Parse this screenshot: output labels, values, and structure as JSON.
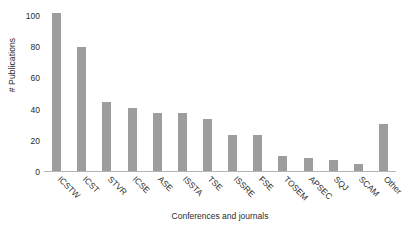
{
  "chart_data": {
    "type": "bar",
    "title": "",
    "xlabel": "Conferences and journals",
    "ylabel": "# Publications",
    "categories": [
      "ICSTW",
      "ICST",
      "STVR",
      "ICSE",
      "ASE",
      "ISSTA",
      "TSE",
      "ISSRE",
      "FSE",
      "TOSEM",
      "APSEC",
      "SQJ",
      "SCAM",
      "Other"
    ],
    "values": [
      102,
      80,
      45,
      41,
      38,
      38,
      34,
      24,
      24,
      10,
      9,
      8,
      5,
      31
    ],
    "ylim": [
      0,
      105
    ],
    "yticks": [
      0,
      20,
      40,
      60,
      80,
      100
    ],
    "ytick_labels": [
      "0",
      "20",
      "40",
      "60",
      "80",
      "100"
    ],
    "grid": false,
    "legend": null,
    "bar_color": "#9d9d9d",
    "axis_color": "#b4b4b4",
    "text_color": "#2b2b2b",
    "background": "#ffffff"
  }
}
